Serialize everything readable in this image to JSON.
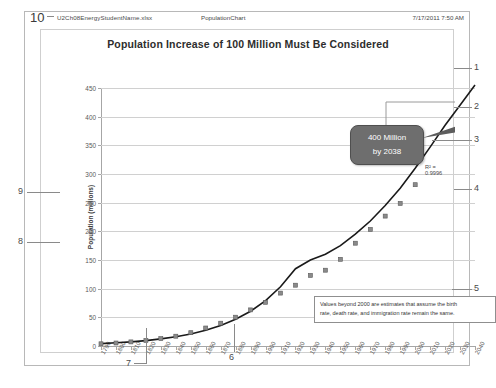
{
  "header": {
    "page_number": "10",
    "filename": "U2Ch08EnergyStudentName.xlsx",
    "center_title": "PopulationChart",
    "timestamp": "7/17/2011 7:50 AM"
  },
  "chart_data": {
    "type": "line",
    "title": "Population Increase of 100 Million Must Be Considered",
    "xlabel": "",
    "ylabel": "Population (millions)",
    "ylim": [
      0,
      450
    ],
    "ytick_step": 50,
    "yticks": [
      "450",
      "400",
      "350",
      "300",
      "250",
      "200",
      "150",
      "100",
      "50",
      "0"
    ],
    "xlim": [
      1790,
      2040
    ],
    "xtick_step": 10,
    "grid": true,
    "legend": "none",
    "categories": [
      "1790",
      "1800",
      "1810",
      "1820",
      "1830",
      "1840",
      "1850",
      "1860",
      "1870",
      "1880",
      "1890",
      "1900",
      "1910",
      "1920",
      "1930",
      "1940",
      "1950",
      "1960",
      "1970",
      "1980",
      "1990",
      "2000",
      "2010",
      "2020",
      "2030",
      "2040"
    ],
    "series": [
      {
        "name": "Population",
        "marker": "square",
        "values": [
          3.9,
          5.3,
          7.2,
          9.6,
          12.9,
          17.1,
          23.2,
          31.4,
          39.8,
          50.2,
          62.9,
          76.2,
          92.2,
          106.0,
          123.2,
          132.2,
          151.3,
          179.3,
          203.3,
          226.5,
          248.7,
          281.4,
          null,
          null,
          null,
          null
        ]
      },
      {
        "name": "Trendline (exponential fit)",
        "style": "solid-extrapolated",
        "values": [
          4.2,
          5.5,
          7.2,
          9.4,
          12.3,
          16.0,
          20.9,
          27.3,
          35.6,
          46.5,
          60.7,
          79.2,
          103.3,
          134.8,
          150.0,
          160.0,
          175.0,
          195.0,
          218.0,
          245.0,
          275.0,
          310.0,
          347.0,
          385.0,
          420.0,
          455.0
        ]
      }
    ],
    "annotations": [
      {
        "name": "callout-bubble",
        "line1": "400  Million",
        "line2": "by 2038"
      },
      {
        "name": "r-squared-label",
        "text": "R² = 0.9996"
      },
      {
        "name": "note-box",
        "line1": "Values beyond 2000 are estimates that assume the birth",
        "line2": "rate, death rate, and immigration rate remain the same."
      }
    ]
  },
  "markers": {
    "right": [
      "1",
      "2",
      "3",
      "4",
      "5"
    ],
    "bottom": [
      "6",
      "7"
    ],
    "left": [
      "8",
      "9"
    ]
  },
  "colors": {
    "callout_fill": "#6e6e6e",
    "gridline": "#d0d0d0",
    "axis": "#a6a6a6",
    "series": "#1a1a1a"
  }
}
